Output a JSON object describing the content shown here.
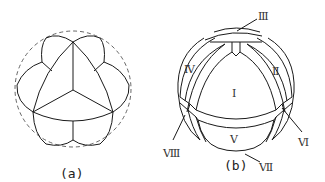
{
  "figure_a": {
    "caption": "(a)",
    "description": "Sphere with dashed outline; curved-triangle central face with three radial edges, surrounded by lobed faces"
  },
  "figure_b": {
    "caption": "(b)",
    "labels": {
      "I": "Ⅰ",
      "II": "Ⅱ",
      "III": "Ⅲ",
      "IV": "Ⅳ",
      "V": "Ⅴ",
      "VI": "Ⅵ",
      "VII": "Ⅶ",
      "VIII": "Ⅷ"
    }
  },
  "colors": {
    "line": "#1a1a1a",
    "dashed": "#555555",
    "background": "#ffffff"
  }
}
